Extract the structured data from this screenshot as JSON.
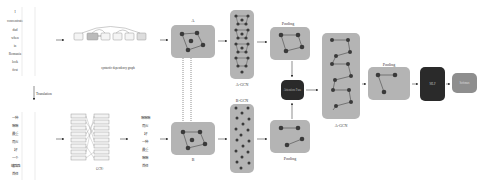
{
  "english_sentence": {
    "words": [
      "I",
      "concentrate",
      "dad",
      "when",
      "in",
      "Romania",
      "look",
      "first"
    ]
  },
  "translation_label": "Translation",
  "chinese_sentence": {
    "words": [
      "一种",
      "嘛嘛",
      "最重",
      "而火",
      "好",
      "一个",
      "罐路路",
      "首任"
    ]
  },
  "dependency_graph_label": "syntactic dependency graph",
  "cross_attention_label": "GCN+",
  "chinese_sentence_2": {
    "words": [
      "嘛嘛嘛",
      "而火",
      "好",
      "一种",
      "最重",
      "嘛嘛",
      "首任"
    ]
  },
  "nodes": {
    "graph_a_label": "A",
    "graph_b_label": "B",
    "a_gcn_label": "A-GCN",
    "b_gcn_label": "B-GCN",
    "pooling_top_label": "Pooling",
    "pooling_bottom_label": "Pooling",
    "attention_fusion_label": "Attention Fuse",
    "a_gcn_2_label": "A-GCN",
    "pooling_final_label": "Pooling",
    "mlp_label": "MLP",
    "softmax_label": "Softmax"
  },
  "colors": {
    "graph_box": "#b4b4b4",
    "dark_box": "#2a2a2a",
    "softmax_box": "#8e8e8e",
    "node": "#3a3a3a"
  }
}
